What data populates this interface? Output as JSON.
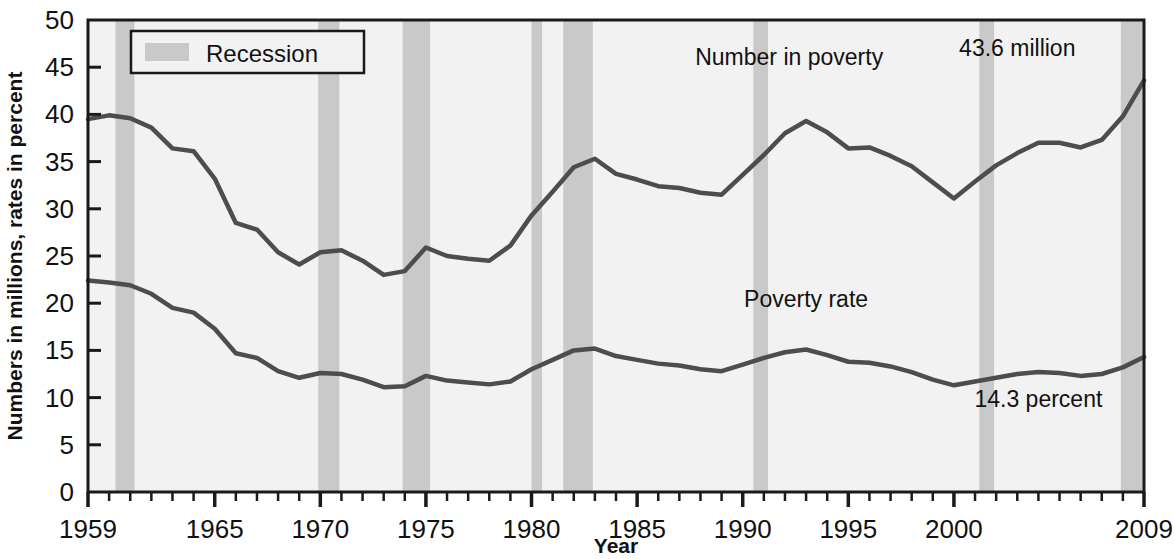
{
  "chart_data": {
    "type": "line",
    "title": "",
    "xlabel": "Year",
    "ylabel": "Numbers in millions, rates in percent",
    "xlim": [
      1959,
      2009
    ],
    "ylim": [
      0,
      50
    ],
    "grid": false,
    "legend_position": "top-left",
    "x": [
      1959,
      1960,
      1961,
      1962,
      1963,
      1964,
      1965,
      1966,
      1967,
      1968,
      1969,
      1970,
      1971,
      1972,
      1973,
      1974,
      1975,
      1976,
      1977,
      1978,
      1979,
      1980,
      1981,
      1982,
      1983,
      1984,
      1985,
      1986,
      1987,
      1988,
      1989,
      1990,
      1991,
      1992,
      1993,
      1994,
      1995,
      1996,
      1997,
      1998,
      1999,
      2000,
      2001,
      2002,
      2003,
      2004,
      2005,
      2006,
      2007,
      2008,
      2009
    ],
    "xticks": [
      1959,
      1965,
      1970,
      1975,
      1980,
      1985,
      1990,
      1995,
      2000,
      2009
    ],
    "xtick_labels": [
      "1959",
      "1965",
      "1970",
      "1975",
      "1980",
      "1985",
      "1990",
      "1995",
      "2000",
      "2009"
    ],
    "yticks": [
      0,
      5,
      10,
      15,
      20,
      25,
      30,
      35,
      40,
      45,
      50
    ],
    "ytick_labels": [
      "0",
      "5",
      "10",
      "15",
      "20",
      "25",
      "30",
      "35",
      "40",
      "45",
      "50"
    ],
    "series": [
      {
        "name": "Number in poverty",
        "unit": "millions",
        "color": "#4d4d4d",
        "values": [
          39.5,
          39.9,
          39.6,
          38.6,
          36.4,
          36.1,
          33.2,
          28.5,
          27.8,
          25.4,
          24.1,
          25.4,
          25.6,
          24.5,
          23.0,
          23.4,
          25.9,
          25.0,
          24.7,
          24.5,
          26.1,
          29.3,
          31.8,
          34.4,
          35.3,
          33.7,
          33.1,
          32.4,
          32.2,
          31.7,
          31.5,
          33.6,
          35.7,
          38.0,
          39.3,
          38.1,
          36.4,
          36.5,
          35.6,
          34.5,
          32.8,
          31.1,
          32.9,
          34.6,
          35.9,
          37.0,
          37.0,
          36.5,
          37.3,
          39.8,
          43.6
        ],
        "end_label": "43.6 million"
      },
      {
        "name": "Poverty rate",
        "unit": "percent",
        "color": "#4d4d4d",
        "values": [
          22.4,
          22.2,
          21.9,
          21.0,
          19.5,
          19.0,
          17.3,
          14.7,
          14.2,
          12.8,
          12.1,
          12.6,
          12.5,
          11.9,
          11.1,
          11.2,
          12.3,
          11.8,
          11.6,
          11.4,
          11.7,
          13.0,
          14.0,
          15.0,
          15.2,
          14.4,
          14.0,
          13.6,
          13.4,
          13.0,
          12.8,
          13.5,
          14.2,
          14.8,
          15.1,
          14.5,
          13.8,
          13.7,
          13.3,
          12.7,
          11.9,
          11.3,
          11.7,
          12.1,
          12.5,
          12.7,
          12.6,
          12.3,
          12.5,
          13.2,
          14.3
        ],
        "end_label": "14.3 percent"
      }
    ],
    "recessions": [
      {
        "start": 1960.3,
        "end": 1961.2
      },
      {
        "start": 1969.9,
        "end": 1970.9
      },
      {
        "start": 1973.9,
        "end": 1975.2
      },
      {
        "start": 1980.0,
        "end": 1980.5
      },
      {
        "start": 1981.5,
        "end": 1982.9
      },
      {
        "start": 1990.5,
        "end": 1991.2
      },
      {
        "start": 2001.2,
        "end": 2001.9
      },
      {
        "start": 2007.9,
        "end": 2009.0
      }
    ],
    "legend": [
      {
        "label": "Recession",
        "swatch_color": "#c9c9c9"
      }
    ],
    "annotations": [
      {
        "text": "Number in poverty",
        "x": 1992.2,
        "y": 45.2
      },
      {
        "text": "43.6 million",
        "x": 2003.0,
        "y": 46.2
      },
      {
        "text": "Poverty rate",
        "x": 1993.0,
        "y": 19.6
      },
      {
        "text": "14.3 percent",
        "x": 2004.0,
        "y": 9.0
      }
    ],
    "colors": {
      "plot_background": "#f2f2f2",
      "recession_band": "#c9c9c9",
      "line": "#4d4d4d",
      "axis": "#1a1a1a",
      "text": "#111111"
    }
  }
}
